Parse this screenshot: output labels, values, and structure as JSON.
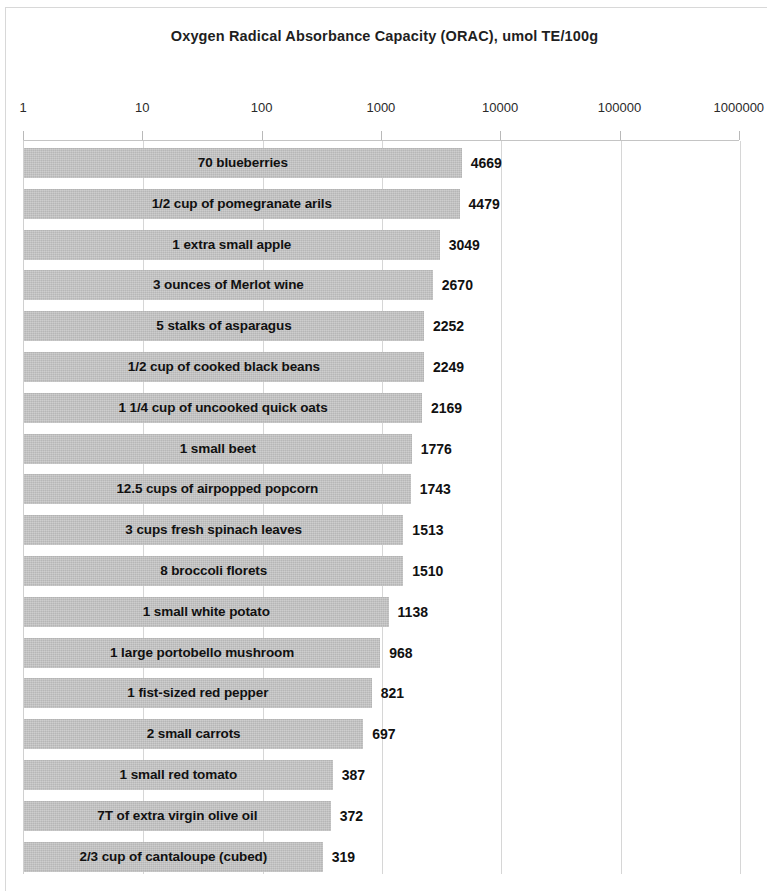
{
  "chart_data": {
    "type": "bar",
    "orientation": "horizontal",
    "title": "Oxygen Radical Absorbance Capacity (ORAC), umol TE/100g",
    "xlabel": "",
    "ylabel": "",
    "xscale": "log",
    "xlim": [
      1,
      1000000
    ],
    "grid": true,
    "legend": false,
    "xticks": [
      1,
      10,
      100,
      1000,
      10000,
      100000,
      1000000
    ],
    "xtick_labels": [
      "1",
      "10",
      "100",
      "1000",
      "10000",
      "100000",
      "1000000"
    ],
    "bar_color": "#c3c3c3",
    "categories": [
      "70 blueberries",
      "1/2 cup of pomegranate arils",
      "1 extra small apple",
      "3 ounces of Merlot wine",
      "5 stalks of asparagus",
      "1/2 cup of cooked black beans",
      "1 1/4 cup of uncooked quick oats",
      "1 small beet",
      "12.5 cups of airpopped popcorn",
      "3 cups fresh spinach leaves",
      "8 broccoli florets",
      "1 small white potato",
      "1 large portobello mushroom",
      "1 fist-sized red pepper",
      "2 small carrots",
      "1 small red tomato",
      "7T of extra virgin olive oil",
      "2/3 cup of cantaloupe (cubed)"
    ],
    "values": [
      4669,
      4479,
      3049,
      2670,
      2252,
      2249,
      2169,
      1776,
      1743,
      1513,
      1510,
      1138,
      968,
      821,
      697,
      387,
      372,
      319
    ],
    "value_labels": [
      "4669",
      "4479",
      "3049",
      "2670",
      "2252",
      "2249",
      "2169",
      "1776",
      "1743",
      "1513",
      "1510",
      "1138",
      "968",
      "821",
      "697",
      "387",
      "372",
      "319"
    ]
  }
}
